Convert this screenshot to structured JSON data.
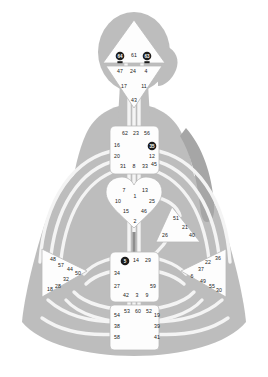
{
  "figure": {
    "colors": {
      "background": "#ffffff",
      "body_silhouette": "#bdbdbd",
      "body_silhouette_shadow": "#a6a6a6",
      "channel_line": "#f4f4f4",
      "center_fill": "#fdfdfd",
      "center_stroke": "#b9b9b9",
      "gate_text": "#1a1a1a",
      "activated_fill": "#1c1c1c",
      "activated_text": "#ffffff",
      "defined_channel": "#8e8e8e"
    }
  },
  "centers": [
    {
      "id": "head",
      "name": "Head Center",
      "shape": "triangle-up",
      "defined": false,
      "gates": [
        {
          "number": "64",
          "x": 120,
          "y": 56,
          "activated": true
        },
        {
          "number": "61",
          "x": 134,
          "y": 56,
          "activated": false
        },
        {
          "number": "63",
          "x": 147,
          "y": 56,
          "activated": true
        }
      ]
    },
    {
      "id": "ajna",
      "name": "Ajna Center",
      "shape": "triangle-down",
      "defined": false,
      "gates": [
        {
          "number": "47",
          "x": 120,
          "y": 72,
          "activated": false
        },
        {
          "number": "24",
          "x": 133,
          "y": 72,
          "activated": false
        },
        {
          "number": "4",
          "x": 146,
          "y": 72,
          "activated": false
        },
        {
          "number": "17",
          "x": 124,
          "y": 87,
          "activated": false
        },
        {
          "number": "11",
          "x": 144,
          "y": 87,
          "activated": false
        },
        {
          "number": "43",
          "x": 134,
          "y": 101,
          "activated": false
        }
      ]
    },
    {
      "id": "throat",
      "name": "Throat Center",
      "shape": "square",
      "defined": false,
      "gates": [
        {
          "number": "62",
          "x": 125,
          "y": 134,
          "activated": false
        },
        {
          "number": "23",
          "x": 136,
          "y": 134,
          "activated": false
        },
        {
          "number": "56",
          "x": 147,
          "y": 134,
          "activated": false
        },
        {
          "number": "16",
          "x": 117,
          "y": 146,
          "activated": false
        },
        {
          "number": "35",
          "x": 152,
          "y": 146,
          "activated": true
        },
        {
          "number": "20",
          "x": 117,
          "y": 157,
          "activated": false
        },
        {
          "number": "12",
          "x": 152,
          "y": 157,
          "activated": false
        },
        {
          "number": "31",
          "x": 123,
          "y": 167,
          "activated": false
        },
        {
          "number": "8",
          "x": 134,
          "y": 167,
          "activated": false
        },
        {
          "number": "33",
          "x": 145,
          "y": 167,
          "activated": false
        },
        {
          "number": "45",
          "x": 154,
          "y": 165,
          "activated": false
        }
      ]
    },
    {
      "id": "g-center",
      "name": "G Center",
      "shape": "heart",
      "defined": false,
      "gates": [
        {
          "number": "7",
          "x": 124,
          "y": 191,
          "activated": false
        },
        {
          "number": "13",
          "x": 145,
          "y": 191,
          "activated": false
        },
        {
          "number": "1",
          "x": 135,
          "y": 197,
          "activated": false
        },
        {
          "number": "10",
          "x": 118,
          "y": 202,
          "activated": false
        },
        {
          "number": "25",
          "x": 152,
          "y": 202,
          "activated": false
        },
        {
          "number": "15",
          "x": 126,
          "y": 212,
          "activated": false
        },
        {
          "number": "46",
          "x": 144,
          "y": 212,
          "activated": false
        },
        {
          "number": "2",
          "x": 135,
          "y": 222,
          "activated": false
        }
      ]
    },
    {
      "id": "ego",
      "name": "Ego / Heart Center",
      "shape": "triangle-right",
      "defined": false,
      "gates": [
        {
          "number": "51",
          "x": 176,
          "y": 219,
          "activated": false
        },
        {
          "number": "21",
          "x": 185,
          "y": 228,
          "activated": false
        },
        {
          "number": "26",
          "x": 165,
          "y": 236,
          "activated": false
        },
        {
          "number": "40",
          "x": 192,
          "y": 236,
          "activated": false
        }
      ]
    },
    {
      "id": "spleen",
      "name": "Spleen Center",
      "shape": "triangle-left",
      "defined": false,
      "gates": [
        {
          "number": "48",
          "x": 53,
          "y": 260,
          "activated": false
        },
        {
          "number": "57",
          "x": 61,
          "y": 266,
          "activated": false
        },
        {
          "number": "44",
          "x": 70,
          "y": 270,
          "activated": false
        },
        {
          "number": "50",
          "x": 78,
          "y": 274,
          "activated": false
        },
        {
          "number": "32",
          "x": 66,
          "y": 280,
          "activated": false
        },
        {
          "number": "28",
          "x": 58,
          "y": 287,
          "activated": false
        },
        {
          "number": "18",
          "x": 50,
          "y": 290,
          "activated": false
        }
      ]
    },
    {
      "id": "solar-plexus",
      "name": "Solar Plexus Center",
      "shape": "triangle-right",
      "defined": false,
      "gates": [
        {
          "number": "36",
          "x": 218,
          "y": 259,
          "activated": false
        },
        {
          "number": "22",
          "x": 208,
          "y": 263,
          "activated": false
        },
        {
          "number": "37",
          "x": 201,
          "y": 270,
          "activated": false
        },
        {
          "number": "6",
          "x": 192,
          "y": 277,
          "activated": false
        },
        {
          "number": "49",
          "x": 203,
          "y": 282,
          "activated": false
        },
        {
          "number": "55",
          "x": 212,
          "y": 287,
          "activated": false
        },
        {
          "number": "30",
          "x": 219,
          "y": 291,
          "activated": false
        }
      ]
    },
    {
      "id": "sacral",
      "name": "Sacral Center",
      "shape": "square",
      "defined": false,
      "gates": [
        {
          "number": "5",
          "x": 125,
          "y": 261,
          "activated": true
        },
        {
          "number": "14",
          "x": 136,
          "y": 261,
          "activated": false
        },
        {
          "number": "29",
          "x": 148,
          "y": 261,
          "activated": false
        },
        {
          "number": "34",
          "x": 117,
          "y": 274,
          "activated": false
        },
        {
          "number": "27",
          "x": 117,
          "y": 287,
          "activated": false
        },
        {
          "number": "59",
          "x": 153,
          "y": 287,
          "activated": false
        },
        {
          "number": "42",
          "x": 126,
          "y": 296,
          "activated": false
        },
        {
          "number": "3",
          "x": 137,
          "y": 296,
          "activated": false
        },
        {
          "number": "9",
          "x": 147,
          "y": 296,
          "activated": false
        }
      ]
    },
    {
      "id": "root",
      "name": "Root Center",
      "shape": "square",
      "defined": false,
      "gates": [
        {
          "number": "53",
          "x": 127,
          "y": 312,
          "activated": false
        },
        {
          "number": "60",
          "x": 138,
          "y": 312,
          "activated": false
        },
        {
          "number": "52",
          "x": 149,
          "y": 312,
          "activated": false
        },
        {
          "number": "54",
          "x": 117,
          "y": 316,
          "activated": false
        },
        {
          "number": "19",
          "x": 157,
          "y": 316,
          "activated": false
        },
        {
          "number": "38",
          "x": 117,
          "y": 327,
          "activated": false
        },
        {
          "number": "39",
          "x": 157,
          "y": 327,
          "activated": false
        },
        {
          "number": "58",
          "x": 117,
          "y": 338,
          "activated": false
        },
        {
          "number": "41",
          "x": 157,
          "y": 338,
          "activated": false
        }
      ]
    }
  ],
  "activations": {
    "count": 4,
    "gates": [
      "64",
      "63",
      "35",
      "5"
    ]
  }
}
